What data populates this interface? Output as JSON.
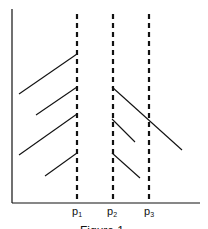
{
  "figure": {
    "caption": "Figure 1",
    "colors": {
      "stroke": "#111111",
      "background": "#ffffff"
    }
  },
  "diagram": {
    "axes": {
      "x_axis": {
        "x1": 12,
        "x2": 200,
        "y": 203
      },
      "y_axis": {
        "x": 12,
        "y1": 9,
        "y2": 203
      }
    },
    "vertical_dashed_lines": [
      {
        "id": "p1",
        "label": "p",
        "subscript": "1",
        "x": 77
      },
      {
        "id": "p2",
        "label": "p",
        "subscript": "2",
        "x": 113
      },
      {
        "id": "p3",
        "label": "p",
        "subscript": "3",
        "x": 149
      }
    ],
    "left_segments": [
      {
        "x1": 19,
        "y1": 94,
        "x2": 77,
        "y2": 54
      },
      {
        "x1": 36,
        "y1": 115,
        "x2": 77,
        "y2": 87
      },
      {
        "x1": 19,
        "y1": 155,
        "x2": 77,
        "y2": 114
      },
      {
        "x1": 45,
        "y1": 176,
        "x2": 77,
        "y2": 153
      }
    ],
    "right_segments": [
      {
        "x1": 112,
        "y1": 87,
        "x2": 182,
        "y2": 150
      },
      {
        "x1": 112,
        "y1": 119,
        "x2": 135,
        "y2": 142
      },
      {
        "x1": 112,
        "y1": 153,
        "x2": 140,
        "y2": 178
      }
    ]
  }
}
